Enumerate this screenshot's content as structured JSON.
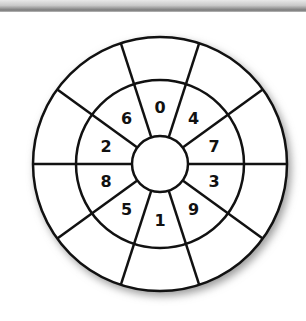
{
  "diagram": {
    "type": "concentric-ring-wheel",
    "sectors": 10,
    "rings": [
      "center-circle",
      "number-ring",
      "outer-blank-ring"
    ],
    "numbers_clockwise_from_top": [
      "0",
      "4",
      "7",
      "3",
      "9",
      "1",
      "5",
      "8",
      "2",
      "6"
    ],
    "outer_ring_values": [
      "",
      "",
      "",
      "",
      "",
      "",
      "",
      "",
      "",
      ""
    ],
    "center_value": "",
    "colors": {
      "line": "#111111",
      "fill": "#ffffff",
      "shadow": "#9a9a9a"
    }
  },
  "labels": {
    "n0": "0",
    "n1": "4",
    "n2": "7",
    "n3": "3",
    "n4": "9",
    "n5": "1",
    "n6": "5",
    "n7": "8",
    "n8": "2",
    "n9": "6"
  }
}
